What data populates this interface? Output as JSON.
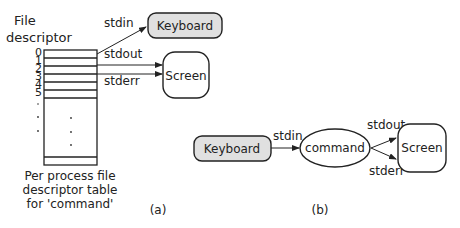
{
  "diagram_a": {
    "title_line1": "File",
    "title_line2": "descriptor",
    "fd_numbers": [
      "0",
      "1",
      "2",
      "3",
      "4",
      "5"
    ],
    "stdin_label": "stdin",
    "stdout_label": "stdout",
    "stderr_label": "stderr",
    "keyboard_label": "Keyboard",
    "screen_label": "Screen",
    "caption_line1": "Per process file",
    "caption_line2": "descriptor table",
    "caption_line3": "for 'command'",
    "panel_label": "(a)"
  },
  "diagram_b": {
    "keyboard_label": "Keyboard",
    "command_label": "command",
    "screen_label": "Screen",
    "stdin_label": "stdin",
    "stdout_label": "stdout",
    "stderr_label": "stderr",
    "panel_label": "(b)"
  },
  "colors": {
    "keyboard_fill": "#e0e0e0",
    "stroke": "#222222"
  }
}
